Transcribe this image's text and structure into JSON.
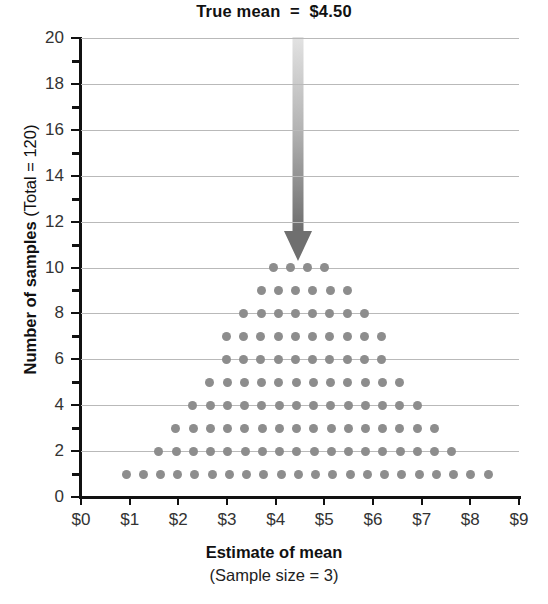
{
  "chart_data": {
    "type": "scatter",
    "title": "True mean  =  $4.50",
    "xlabel": "Estimate of mean",
    "xsublabel": "(Sample size = 3)",
    "ylabel": "Number of samples (Total = 120)",
    "ylabel_bold_part": "Number of samples",
    "ylabel_light_part": " (Total = 120)",
    "xlim": [
      0,
      9
    ],
    "ylim": [
      0,
      20
    ],
    "xtick_labels": [
      "$0",
      "$1",
      "$2",
      "$3",
      "$4",
      "$5",
      "$6",
      "$7",
      "$8",
      "$9"
    ],
    "xtick_values": [
      0,
      1,
      2,
      3,
      4,
      5,
      6,
      7,
      8,
      9
    ],
    "ytick_labels": [
      "0",
      "2",
      "4",
      "6",
      "8",
      "10",
      "12",
      "14",
      "16",
      "18",
      "20"
    ],
    "ytick_values": [
      0,
      2,
      4,
      6,
      8,
      10,
      12,
      14,
      16,
      18,
      20
    ],
    "yminor_values": [
      1,
      3,
      5,
      7,
      9,
      11,
      13,
      15,
      17,
      19
    ],
    "grid": "horizontal",
    "legend": "none",
    "dot_color": "#8d8d8d",
    "axis_color": "#111111",
    "grid_color": "#b9b9b9",
    "annotation": {
      "label": "True mean  =  $4.50",
      "value": 4.5,
      "marker": "down-arrow",
      "arrow_top_y": 20,
      "arrow_tip_y": 10.4,
      "color_top": "#dcdcdc",
      "color_bottom": "#6e6e6e"
    },
    "dot_spacing_dollars": 0.3542,
    "total_samples": 120,
    "rows": [
      {
        "count": 1,
        "dots": 22,
        "x_start": 0.925
      },
      {
        "count": 2,
        "dots": 18,
        "x_start": 1.6
      },
      {
        "count": 3,
        "dots": 16,
        "x_start": 1.95
      },
      {
        "count": 4,
        "dots": 14,
        "x_start": 2.3
      },
      {
        "count": 5,
        "dots": 12,
        "x_start": 2.65
      },
      {
        "count": 6,
        "dots": 10,
        "x_start": 2.99
      },
      {
        "count": 7,
        "dots": 10,
        "x_start": 2.99
      },
      {
        "count": 8,
        "dots": 8,
        "x_start": 3.345
      },
      {
        "count": 9,
        "dots": 6,
        "x_start": 3.7
      },
      {
        "count": 10,
        "dots": 4,
        "x_start": 3.95
      }
    ]
  }
}
